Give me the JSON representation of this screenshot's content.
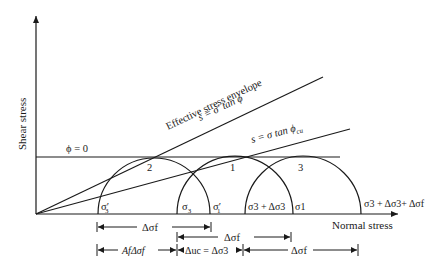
{
  "axes": {
    "y_label": "Shear stress",
    "x_label": "Normal stress"
  },
  "envelopes": {
    "effective_title": "Effective stress envelope",
    "effective_eq": "s = σ′ tan ϕ",
    "total_eq": "s = σ tan ϕ",
    "total_eq_sub": "cu",
    "phi_zero": "ϕ = 0"
  },
  "circles": {
    "c2": "2",
    "c1": "1",
    "c3": "3"
  },
  "points": {
    "sigma3_eff": "σ′",
    "sigma3_eff_sub": "3",
    "sigma3": "σ",
    "sigma3_sub": "3",
    "sigma1_eff": "σ′",
    "sigma1_eff_sub": "1",
    "sigma3_plus_d3": "σ3 + Δσ3",
    "sigma1": "σ1",
    "sigma_final": "σ3 + Δσ3+ Δσf"
  },
  "dimensions": {
    "row1": "Δσf",
    "row2": "Δσf",
    "row3_a": "AfΔσf",
    "row3_b": "Δuc = Δσ3",
    "row3_c": "Δσf"
  },
  "colors": {
    "line": "#1a1a1a",
    "background": "#ffffff"
  }
}
